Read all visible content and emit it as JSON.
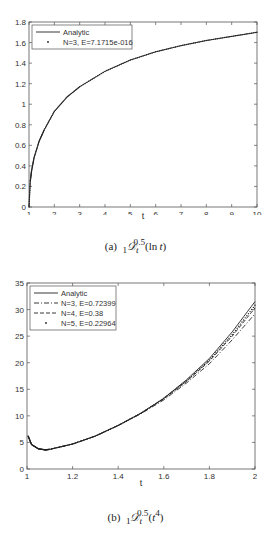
{
  "chart_data": [
    {
      "type": "line",
      "caption": "(a) ₁D_t^0.5(ln t)",
      "xlabel": "t",
      "ylabel": "",
      "xlim": [
        1,
        10
      ],
      "ylim": [
        0,
        1.8
      ],
      "xticks": [
        1,
        2,
        3,
        4,
        5,
        6,
        7,
        8,
        9,
        10
      ],
      "yticks": [
        0,
        0.2,
        0.4,
        0.6,
        0.8,
        1,
        1.2,
        1.4,
        1.6,
        1.8
      ],
      "legend_position": "upper left",
      "grid": false,
      "series": [
        {
          "name": "Analytic",
          "style": "solid",
          "x": [
            1,
            1.05,
            1.1,
            1.2,
            1.4,
            1.6,
            2,
            2.5,
            3,
            4,
            5,
            6,
            7,
            8,
            9,
            10
          ],
          "y": [
            0,
            0.25,
            0.35,
            0.48,
            0.64,
            0.75,
            0.93,
            1.07,
            1.17,
            1.32,
            1.43,
            1.51,
            1.57,
            1.62,
            1.66,
            1.7
          ]
        },
        {
          "name": "N=3, E=7.1715e-016",
          "style": "dots",
          "x": [
            1,
            1.05,
            1.1,
            1.2,
            1.4,
            1.6,
            2,
            2.5,
            3,
            4,
            5,
            6,
            7,
            8,
            9,
            10
          ],
          "y": [
            0,
            0.25,
            0.35,
            0.48,
            0.64,
            0.75,
            0.93,
            1.07,
            1.17,
            1.32,
            1.43,
            1.51,
            1.57,
            1.62,
            1.66,
            1.7
          ]
        }
      ]
    },
    {
      "type": "line",
      "caption": "(b) ₁D_t^0.5(t^4)",
      "xlabel": "t",
      "ylabel": "",
      "xlim": [
        1,
        2
      ],
      "ylim": [
        0,
        35
      ],
      "xticks": [
        1,
        1.2,
        1.4,
        1.6,
        1.8,
        2
      ],
      "yticks": [
        0,
        5,
        10,
        15,
        20,
        25,
        30,
        35
      ],
      "legend_position": "upper left",
      "grid": false,
      "series": [
        {
          "name": "Analytic",
          "style": "solid",
          "x": [
            1.005,
            1.02,
            1.05,
            1.08,
            1.1,
            1.2,
            1.3,
            1.4,
            1.5,
            1.6,
            1.7,
            1.8,
            1.9,
            2
          ],
          "y": [
            6.2,
            4.6,
            3.8,
            3.6,
            3.7,
            4.7,
            6.2,
            8.2,
            10.5,
            13.3,
            16.8,
            20.8,
            25.8,
            31.5
          ]
        },
        {
          "name": "N=3, E=0.72399",
          "style": "dashdot",
          "x": [
            1.005,
            1.02,
            1.05,
            1.08,
            1.1,
            1.2,
            1.3,
            1.4,
            1.5,
            1.6,
            1.7,
            1.8,
            1.9,
            2
          ],
          "y": [
            6.2,
            4.6,
            3.8,
            3.6,
            3.7,
            4.7,
            6.2,
            8.2,
            10.4,
            13.0,
            16.2,
            19.8,
            24.3,
            29.2
          ]
        },
        {
          "name": "N=4, E=0.38",
          "style": "dashed",
          "x": [
            1.005,
            1.02,
            1.05,
            1.08,
            1.1,
            1.2,
            1.3,
            1.4,
            1.5,
            1.6,
            1.7,
            1.8,
            1.9,
            2
          ],
          "y": [
            6.2,
            4.6,
            3.8,
            3.6,
            3.7,
            4.7,
            6.2,
            8.2,
            10.5,
            13.2,
            16.5,
            20.3,
            25.0,
            30.3
          ]
        },
        {
          "name": "N=5, E=0.22964",
          "style": "dots",
          "x": [
            1.005,
            1.02,
            1.05,
            1.08,
            1.1,
            1.2,
            1.3,
            1.4,
            1.5,
            1.6,
            1.7,
            1.8,
            1.9,
            2
          ],
          "y": [
            6.2,
            4.6,
            3.8,
            3.6,
            3.7,
            4.7,
            6.2,
            8.2,
            10.5,
            13.3,
            16.6,
            20.5,
            25.3,
            30.8
          ]
        }
      ]
    }
  ],
  "figures": [
    {
      "caption_label": "(a)",
      "xlabel": "t",
      "legend": [
        "Analytic",
        "N=3, E=7.1715e-016"
      ]
    },
    {
      "caption_label": "(b)",
      "xlabel": "t",
      "legend": [
        "Analytic",
        "N=3, E=0.72399",
        "N=4, E=0.38",
        "N=5, E=0.22964"
      ]
    }
  ]
}
